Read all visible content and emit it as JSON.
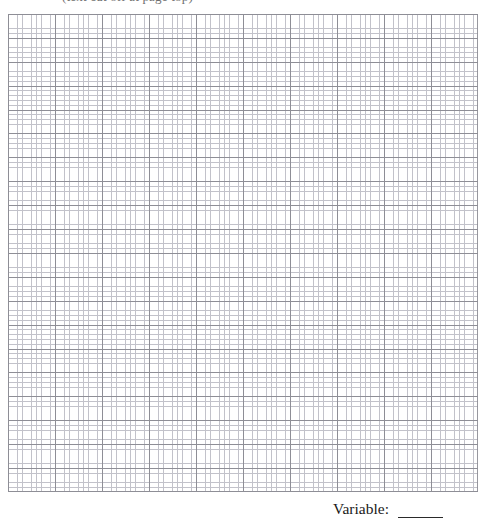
{
  "page": {
    "background_color": "#ffffff",
    "width": 487,
    "height": 524
  },
  "header": {
    "clipped_text": "(text cut off at page top)"
  },
  "graph": {
    "type": "grid-paper",
    "minor_cell_px": 4.7,
    "major_cell_px": 23.5,
    "minor_line_color": "#c2c2ca",
    "major_line_color": "#8e8e96",
    "columns_major": 20,
    "rows_major": 20,
    "aria_label": "blank graph paper plotting area"
  },
  "caption": {
    "label": "Variable:",
    "blank_value": ""
  }
}
